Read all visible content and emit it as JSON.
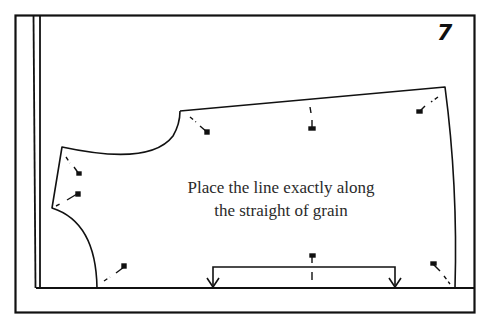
{
  "figure": {
    "step_number": "7",
    "caption": {
      "line1": "Place the line exactly along",
      "line2": "the straight of grain"
    },
    "colors": {
      "ink": "#111111",
      "background": "#ffffff",
      "caption_text": "#2a2a2a"
    },
    "elements": {
      "frame": "outer-border",
      "selvage": "double-vertical-lines",
      "fold_line": "horizontal-base-line",
      "pattern_piece": "bodice-pattern-outline",
      "grainline": "grainline-bracket-with-arrows",
      "pins": 9
    }
  }
}
